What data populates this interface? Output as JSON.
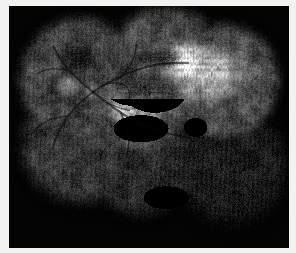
{
  "figure": {
    "title": "Retinal fluorescein angiography montage",
    "modality": "Fluorescein angiography",
    "eye_region": "Posterior pole with nasal and inferotemporal extension",
    "background_color": "#030303",
    "paper_color": "#f2f2f0",
    "plate": {
      "x": 9,
      "y": 6,
      "width": 280,
      "height": 242
    }
  },
  "image_data": {
    "type": "grayscale-photograph",
    "width": 296,
    "height": 253,
    "tone_range": {
      "min": 0,
      "max": 255
    },
    "mean_luminance": 58,
    "grain_amount": 0.16,
    "scanline_amount": 0.1,
    "vignette_strength": 0.55,
    "montage_fields": [
      {
        "name": "field-superonasal",
        "cx": 0.255,
        "cy": 0.3,
        "r": 0.268,
        "gain": 0.96,
        "core": 0.7
      },
      {
        "name": "field-superotemporal",
        "cx": 0.56,
        "cy": 0.25,
        "r": 0.268,
        "gain": 1.0,
        "core": 0.66
      },
      {
        "name": "field-temporal-bright",
        "cx": 0.76,
        "cy": 0.305,
        "r": 0.25,
        "gain": 1.1,
        "core": 0.68
      },
      {
        "name": "field-macula-center",
        "cx": 0.465,
        "cy": 0.4,
        "r": 0.23,
        "gain": 1.04,
        "core": 0.62
      },
      {
        "name": "field-inferonasal",
        "cx": 0.25,
        "cy": 0.57,
        "r": 0.268,
        "gain": 0.78,
        "core": 0.62
      },
      {
        "name": "field-inferior",
        "cx": 0.47,
        "cy": 0.64,
        "r": 0.25,
        "gain": 0.62,
        "core": 0.58
      },
      {
        "name": "field-inferotemporal-dark",
        "cx": 0.79,
        "cy": 0.66,
        "r": 0.275,
        "gain": 0.4,
        "core": 0.52
      }
    ],
    "bright_lesions": [
      {
        "name": "hyperfluorescent-staining-temporal",
        "cx": 0.7,
        "cy": 0.27,
        "rx": 0.15,
        "ry": 0.12,
        "intensity": 0.95,
        "mottle": 0.85
      },
      {
        "name": "hyperfluorescent-staining-superotemporal",
        "cx": 0.61,
        "cy": 0.21,
        "rx": 0.09,
        "ry": 0.075,
        "intensity": 0.8,
        "mottle": 0.8
      },
      {
        "name": "disciform-scar-central",
        "cx": 0.47,
        "cy": 0.4,
        "rx": 0.11,
        "ry": 0.095,
        "intensity": 0.88,
        "mottle": 0.92
      },
      {
        "name": "window-defect-perifoveal",
        "cx": 0.4,
        "cy": 0.44,
        "rx": 0.045,
        "ry": 0.055,
        "intensity": 0.7,
        "mottle": 0.7
      },
      {
        "name": "staining-nasal-edge",
        "cx": 0.21,
        "cy": 0.33,
        "rx": 0.05,
        "ry": 0.045,
        "intensity": 0.55,
        "mottle": 0.6
      },
      {
        "name": "leak-inferotemporal-faint",
        "cx": 0.56,
        "cy": 0.79,
        "rx": 0.06,
        "ry": 0.035,
        "intensity": 0.32,
        "mottle": 0.5
      }
    ],
    "dark_lesions": [
      {
        "name": "hemorrhage-superonasal",
        "cx": 0.25,
        "cy": 0.215,
        "rx": 0.075,
        "ry": 0.065,
        "depth": 0.92,
        "mottle": 0.9
      },
      {
        "name": "hemorrhage-superotemporal",
        "cx": 0.56,
        "cy": 0.215,
        "rx": 0.055,
        "ry": 0.048,
        "depth": 0.88,
        "mottle": 0.88
      },
      {
        "name": "blocked-fluorescence-central",
        "cx": 0.52,
        "cy": 0.355,
        "rx": 0.08,
        "ry": 0.06,
        "depth": 0.85,
        "mottle": 0.85
      },
      {
        "name": "blocked-fluorescence-subfoveal",
        "cx": 0.44,
        "cy": 0.34,
        "rx": 0.07,
        "ry": 0.05,
        "depth": 0.8,
        "mottle": 0.8
      },
      {
        "name": "hemorrhage-inferotemporal",
        "cx": 0.665,
        "cy": 0.5,
        "rx": 0.03,
        "ry": 0.028,
        "depth": 0.9,
        "mottle": 0.7
      },
      {
        "name": "blocked-fluorescence-inferocentral",
        "cx": 0.47,
        "cy": 0.505,
        "rx": 0.07,
        "ry": 0.04,
        "depth": 0.62,
        "mottle": 0.7
      }
    ],
    "optic_disc": {
      "name": "optic-disc",
      "cx": 0.3,
      "cy": 0.355,
      "r": 0.028,
      "intensity": 0.55
    },
    "vessels": [
      {
        "name": "superior-temporal-arcade",
        "points": [
          [
            0.3,
            0.355
          ],
          [
            0.35,
            0.32
          ],
          [
            0.42,
            0.28
          ],
          [
            0.49,
            0.25
          ],
          [
            0.56,
            0.235
          ],
          [
            0.64,
            0.235
          ]
        ],
        "width": 2.1,
        "tone": 0.3
      },
      {
        "name": "superior-temporal-branch",
        "points": [
          [
            0.4,
            0.292
          ],
          [
            0.43,
            0.25
          ],
          [
            0.45,
            0.205
          ],
          [
            0.455,
            0.16
          ]
        ],
        "width": 1.5,
        "tone": 0.32
      },
      {
        "name": "inferior-temporal-arcade",
        "points": [
          [
            0.3,
            0.355
          ],
          [
            0.35,
            0.4
          ],
          [
            0.41,
            0.45
          ],
          [
            0.48,
            0.495
          ],
          [
            0.56,
            0.525
          ],
          [
            0.64,
            0.545
          ]
        ],
        "width": 2.0,
        "tone": 0.3
      },
      {
        "name": "inferior-temporal-branch",
        "points": [
          [
            0.4,
            0.442
          ],
          [
            0.42,
            0.5
          ],
          [
            0.43,
            0.56
          ],
          [
            0.42,
            0.625
          ]
        ],
        "width": 1.4,
        "tone": 0.33
      },
      {
        "name": "superior-nasal-arcade",
        "points": [
          [
            0.3,
            0.355
          ],
          [
            0.258,
            0.315
          ],
          [
            0.215,
            0.268
          ],
          [
            0.18,
            0.215
          ],
          [
            0.158,
            0.165
          ]
        ],
        "width": 1.7,
        "tone": 0.32
      },
      {
        "name": "inferior-nasal-arcade",
        "points": [
          [
            0.3,
            0.355
          ],
          [
            0.252,
            0.4
          ],
          [
            0.208,
            0.455
          ],
          [
            0.175,
            0.52
          ],
          [
            0.155,
            0.59
          ]
        ],
        "width": 1.7,
        "tone": 0.32
      },
      {
        "name": "nasal-branch-upper",
        "points": [
          [
            0.215,
            0.268
          ],
          [
            0.175,
            0.258
          ],
          [
            0.135,
            0.262
          ],
          [
            0.1,
            0.28
          ]
        ],
        "width": 1.1,
        "tone": 0.36
      },
      {
        "name": "nasal-branch-lower",
        "points": [
          [
            0.208,
            0.455
          ],
          [
            0.165,
            0.462
          ],
          [
            0.125,
            0.48
          ],
          [
            0.095,
            0.51
          ]
        ],
        "width": 1.1,
        "tone": 0.36
      },
      {
        "name": "macular-branch",
        "points": [
          [
            0.35,
            0.4
          ],
          [
            0.39,
            0.42
          ],
          [
            0.43,
            0.432
          ]
        ],
        "width": 1.0,
        "tone": 0.38
      },
      {
        "name": "peripapillary-loop",
        "points": [
          [
            0.33,
            0.33
          ],
          [
            0.372,
            0.315
          ],
          [
            0.41,
            0.322
          ],
          [
            0.432,
            0.35
          ],
          [
            0.428,
            0.388
          ]
        ],
        "width": 1.2,
        "tone": 0.34
      }
    ]
  }
}
